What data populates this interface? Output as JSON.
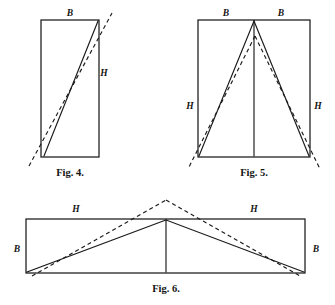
{
  "page": {
    "background": "#ffffff",
    "ink": "#1a1a1a",
    "width": 335,
    "height": 305
  },
  "figures": [
    {
      "id": "fig-4",
      "caption": "Fig. 4.",
      "shape": "vertical-rectangle-with-diagonal",
      "rect": {
        "x": 41,
        "y": 20,
        "width": 58,
        "height": 137
      },
      "labels": {
        "b": "B",
        "h": "H"
      },
      "label_positions": {
        "b": {
          "x": 70,
          "y": 15
        },
        "h": {
          "x": 105,
          "y": 75
        }
      },
      "solid_diagonal": {
        "x1": 44,
        "y1": 157,
        "x2": 99,
        "y2": 20
      },
      "dashed_diagonal": {
        "x1": 29,
        "y1": 166,
        "x2": 112,
        "y2": 13
      },
      "caption_position": {
        "x": 70,
        "y": 175
      }
    },
    {
      "id": "fig-5",
      "caption": "Fig. 5.",
      "shape": "rectangle-with-inscribed-triangle",
      "rect": {
        "x": 198,
        "y": 20,
        "width": 112,
        "height": 137
      },
      "labels": {
        "b_left": "B",
        "b_right": "B",
        "h_left": "H",
        "h_right": "H"
      },
      "label_positions": {
        "b_left": {
          "x": 226,
          "y": 15
        },
        "b_right": {
          "x": 281,
          "y": 15
        },
        "h_left": {
          "x": 190,
          "y": 108
        },
        "h_right": {
          "x": 318,
          "y": 108
        }
      },
      "apex": {
        "x": 254,
        "y": 20
      },
      "center_line": {
        "x1": 254,
        "y1": 20,
        "x2": 254,
        "y2": 157
      },
      "solid_triangle": "198,157 254,20 310,157",
      "dashed_left": {
        "x1": 254,
        "y1": 37,
        "x2": 190,
        "y2": 166
      },
      "dashed_right": {
        "x1": 254,
        "y1": 37,
        "x2": 319,
        "y2": 168
      },
      "caption_position": {
        "x": 254,
        "y": 175
      }
    },
    {
      "id": "fig-6",
      "caption": "Fig. 6.",
      "shape": "wide-rectangle-with-inscribed-triangle",
      "rect": {
        "x": 26,
        "y": 219,
        "width": 279,
        "height": 54
      },
      "labels": {
        "h_left": "H",
        "h_right": "H",
        "b_left": "B",
        "b_right": "B"
      },
      "label_positions": {
        "h_left": {
          "x": 76,
          "y": 211
        },
        "h_right": {
          "x": 254,
          "y": 211
        },
        "b_left": {
          "x": 17,
          "y": 249
        },
        "b_right": {
          "x": 316,
          "y": 249
        }
      },
      "apex": {
        "x": 166,
        "y": 219
      },
      "center_line": {
        "x1": 166,
        "y1": 219,
        "x2": 166,
        "y2": 273
      },
      "solid_triangle_left": {
        "x1": 26,
        "y1": 273,
        "x2": 166,
        "y2": 219
      },
      "solid_triangle_right": {
        "x1": 166,
        "y1": 219,
        "x2": 305,
        "y2": 273
      },
      "dashed_peak": {
        "x": 166,
        "y": 200
      },
      "dashed_left": {
        "x1": 32,
        "y1": 275,
        "x2": 166,
        "y2": 200
      },
      "dashed_right": {
        "x1": 166,
        "y1": 200,
        "x2": 300,
        "y2": 275
      },
      "caption_position": {
        "x": 166,
        "y": 291
      }
    }
  ]
}
